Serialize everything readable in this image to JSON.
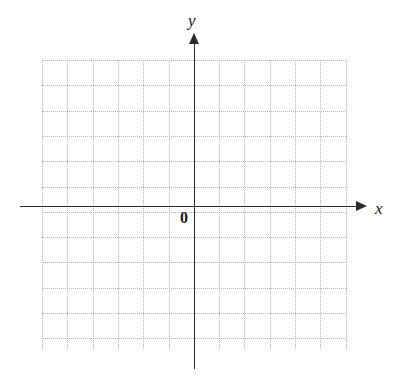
{
  "figure": {
    "width": 393,
    "height": 377,
    "background_color": "#ffffff"
  },
  "axes": {
    "x_label": "x",
    "y_label": "y",
    "origin_label": "0",
    "axis_color": "#2b2b2b",
    "x_axis_y_px": 206,
    "y_axis_x_px": 194,
    "x_arrow": "arrow-right",
    "y_arrow": "arrow-up"
  },
  "grid": {
    "color": "#b4b4b4",
    "style": "dotted",
    "cell_size_px": 25.3,
    "left_px": 42,
    "top_px": 60,
    "width_px": 304,
    "height_px": 289,
    "columns": 12,
    "rows": 11
  },
  "chart_data": {
    "type": "scatter",
    "title": "",
    "subtitle": "",
    "xlabel": "x",
    "ylabel": "y",
    "annotations": [
      "0"
    ],
    "legend": [],
    "legend_position": "none",
    "grid": true,
    "grid_style": "dotted",
    "series": [],
    "x": [],
    "values": [],
    "xlim": [
      -6,
      6
    ],
    "ylim": [
      -5.7,
      5.7
    ],
    "x_tick_labels": [],
    "y_tick_labels": [],
    "x_major_step": 1,
    "y_major_step": 1
  }
}
